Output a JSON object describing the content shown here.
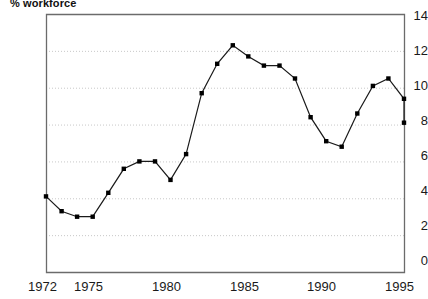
{
  "chart_data": {
    "type": "line",
    "title": "% workforce",
    "xlabel": "",
    "ylabel": "% workforce",
    "x": [
      1972,
      1973,
      1974,
      1975,
      1976,
      1977,
      1978,
      1979,
      1980,
      1981,
      1982,
      1983,
      1984,
      1985,
      1986,
      1987,
      1988,
      1989,
      1990,
      1991,
      1992,
      1993,
      1994,
      1995
    ],
    "values": [
      4.1,
      3.3,
      3.0,
      3.0,
      4.3,
      5.6,
      6.0,
      6.0,
      5.0,
      6.4,
      9.7,
      11.3,
      12.3,
      11.7,
      11.2,
      11.2,
      10.5,
      8.4,
      7.1,
      6.8,
      8.6,
      10.1,
      10.5,
      9.4
    ],
    "final_value": 8.1,
    "xlim": [
      1972,
      1995
    ],
    "ylim": [
      0,
      14
    ],
    "yticks": [
      "0",
      "2",
      "4",
      "6",
      "8",
      "10",
      "12",
      "14"
    ],
    "xticks": [
      "1972",
      "1975",
      "1980",
      "1985",
      "1990",
      "1995"
    ],
    "grid": true,
    "grid_axis": "y",
    "legend": null,
    "marker": "square",
    "line_color": "#1a1a1a",
    "marker_color": "#000000",
    "grid_color": "#c8c8c8",
    "axis_color": "#555555",
    "background": "#ffffff"
  }
}
